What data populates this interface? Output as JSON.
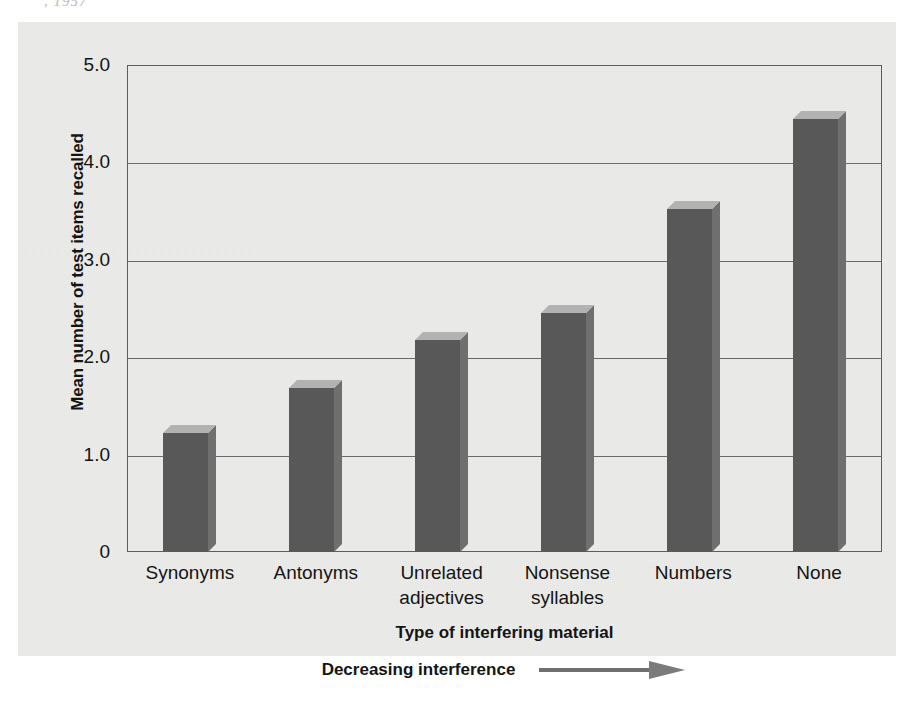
{
  "figure": {
    "cut_caption": ", 1957",
    "background_color": "#ececea",
    "bar_color": "#585858",
    "bar_top_color": "#b2b2b2",
    "bar_side_color": "#6f6f6f",
    "axis_color": "#5d5d5d"
  },
  "chart_data": {
    "type": "bar",
    "title": "",
    "categories": [
      "Synonyms",
      "Antonyms",
      "Unrelated\nadjectives",
      "Nonsense\nsyllables",
      "Numbers",
      "None"
    ],
    "values": [
      1.22,
      1.68,
      2.18,
      2.45,
      3.52,
      4.45
    ],
    "xlabel": "Type of interfering material",
    "ylabel": "Mean number of test items recalled",
    "ylim": [
      0,
      5.0
    ],
    "yticks": [
      0,
      1.0,
      2.0,
      3.0,
      4.0,
      5.0
    ],
    "ytick_labels": [
      "0",
      "1.0",
      "2.0",
      "3.0",
      "4.0",
      "5.0"
    ],
    "grid": "horizontal",
    "legend": "none"
  },
  "annotation": {
    "interference_label": "Decreasing interference",
    "arrow_icon": "right-arrow-icon"
  }
}
